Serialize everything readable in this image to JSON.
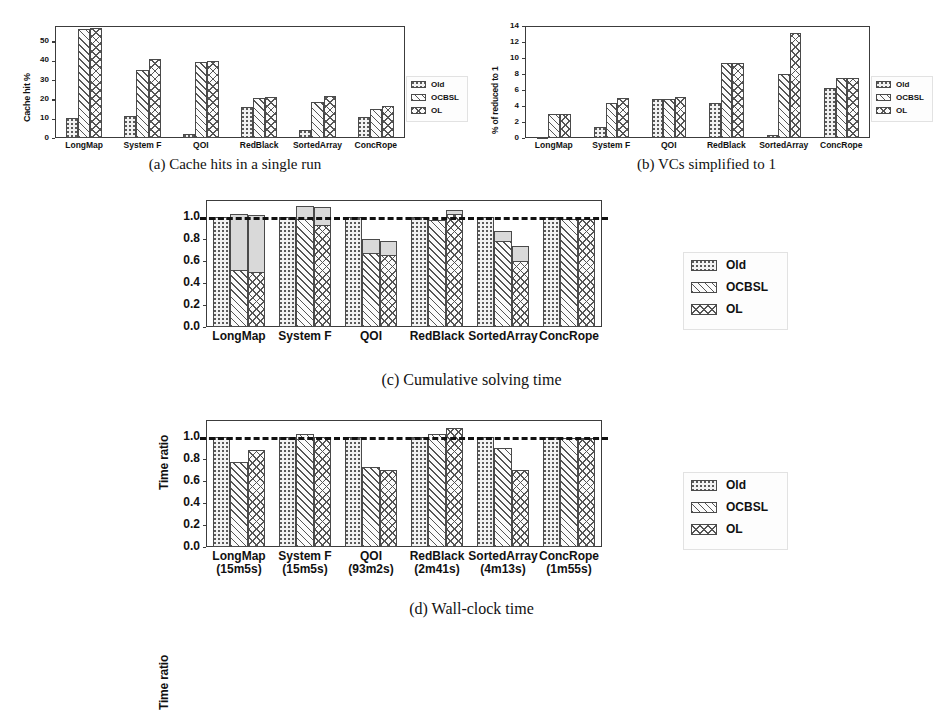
{
  "figure": {
    "panels": [
      {
        "id": "a",
        "caption": "(a) Cache hits in a single run",
        "ylabel": "Cache hit %"
      },
      {
        "id": "b",
        "caption": "(b) VCs simplified to 1",
        "ylabel": "% of reduced to 1"
      },
      {
        "id": "c",
        "caption": "(c) Cumulative solving time",
        "ylabel": "Time ratio"
      },
      {
        "id": "d",
        "caption": "(d) Wall-clock time",
        "ylabel": "Time ratio"
      }
    ],
    "legend": {
      "entries": [
        {
          "label": "Old",
          "fill": "dotted",
          "color": "#f2f2f2"
        },
        {
          "label": "OCBSL",
          "fill": "diagonal-hatch",
          "color": "#fbfbfb"
        },
        {
          "label": "OL",
          "fill": "cross-hatch",
          "color": "#fbfbfb"
        }
      ]
    },
    "reference_line": {
      "value": 1.0,
      "style": "dashed",
      "color": "#111111"
    },
    "stack_cap_color": "#d9d9d9"
  },
  "chart_data": [
    {
      "type": "bar",
      "id": "a",
      "title": "(a) Cache hits in a single run",
      "xlabel": "",
      "ylabel": "Cache hit %",
      "ylim": [
        0,
        58
      ],
      "yticks": [
        0,
        10,
        20,
        30,
        40,
        50
      ],
      "grid": false,
      "legend_position": "right",
      "categories": [
        "LongMap",
        "System F",
        "QOI",
        "RedBlack",
        "SortedArray",
        "ConcRope"
      ],
      "series": [
        {
          "name": "Old",
          "values": [
            10.5,
            11.2,
            2.2,
            16.3,
            4.3,
            11.0
          ]
        },
        {
          "name": "OCBSL",
          "values": [
            56.5,
            35.2,
            39.3,
            20.8,
            18.6,
            15.2
          ]
        },
        {
          "name": "OL",
          "values": [
            56.8,
            40.8,
            40.0,
            21.2,
            22.0,
            16.5
          ]
        }
      ]
    },
    {
      "type": "bar",
      "id": "b",
      "title": "(b) VCs simplified to 1",
      "xlabel": "",
      "ylabel": "% of reduced to 1",
      "ylim": [
        0,
        14
      ],
      "yticks": [
        0,
        2,
        4,
        6,
        8,
        10,
        12,
        14
      ],
      "grid": false,
      "legend_position": "right",
      "categories": [
        "LongMap",
        "System F",
        "QOI",
        "RedBlack",
        "SortedArray",
        "ConcRope"
      ],
      "series": [
        {
          "name": "Old",
          "values": [
            0.15,
            1.4,
            4.85,
            4.4,
            0.35,
            6.3
          ]
        },
        {
          "name": "OCBSL",
          "values": [
            2.95,
            4.4,
            4.9,
            9.35,
            8.0,
            7.5
          ]
        },
        {
          "name": "OL",
          "values": [
            2.95,
            5.05,
            5.15,
            9.35,
            13.1,
            7.5
          ]
        }
      ]
    },
    {
      "type": "bar",
      "id": "c",
      "title": "(c) Cumulative solving time",
      "xlabel": "",
      "ylabel": "Time ratio",
      "ylim": [
        0.0,
        1.15
      ],
      "yticks": [
        0.0,
        0.2,
        0.4,
        0.6,
        0.8,
        1.0
      ],
      "ytick_labels": [
        "0.0",
        "0.2",
        "0.4",
        "0.6",
        "0.8",
        "1.0"
      ],
      "grid": false,
      "legend_position": "right",
      "reference_line": 1.0,
      "stacked_top_segment": "light gray overhead cap",
      "categories": [
        "LongMap",
        "System F",
        "QOI",
        "RedBlack",
        "SortedArray",
        "ConcRope"
      ],
      "series": [
        {
          "name": "Old",
          "values": [
            1.0,
            1.0,
            1.0,
            1.0,
            1.0,
            1.0
          ],
          "totals": [
            1.0,
            1.0,
            1.0,
            1.0,
            1.0,
            1.0
          ]
        },
        {
          "name": "OCBSL",
          "values": [
            0.52,
            0.98,
            0.67,
            0.97,
            0.78,
            0.98
          ],
          "totals": [
            1.02,
            1.1,
            0.8,
            0.97,
            0.87,
            0.98
          ]
        },
        {
          "name": "OL",
          "values": [
            0.5,
            0.92,
            0.65,
            1.02,
            0.6,
            0.98
          ],
          "totals": [
            1.01,
            1.09,
            0.78,
            1.06,
            0.73,
            0.98
          ]
        }
      ]
    },
    {
      "type": "bar",
      "id": "d",
      "title": "(d) Wall-clock time",
      "xlabel": "",
      "ylabel": "Time ratio",
      "ylim": [
        0.0,
        1.15
      ],
      "yticks": [
        0.0,
        0.2,
        0.4,
        0.6,
        0.8,
        1.0
      ],
      "ytick_labels": [
        "0.0",
        "0.2",
        "0.4",
        "0.6",
        "0.8",
        "1.0"
      ],
      "grid": false,
      "legend_position": "right",
      "reference_line": 1.0,
      "categories": [
        "LongMap",
        "System F",
        "QOI",
        "RedBlack",
        "SortedArray",
        "ConcRope"
      ],
      "category_sublabels": [
        "(15m5s)",
        "(15m5s)",
        "(93m2s)",
        "(2m41s)",
        "(4m13s)",
        "(1m55s)"
      ],
      "series": [
        {
          "name": "Old",
          "values": [
            1.0,
            1.0,
            1.0,
            1.0,
            1.0,
            1.0
          ]
        },
        {
          "name": "OCBSL",
          "values": [
            0.77,
            1.02,
            0.72,
            1.02,
            0.9,
            0.99
          ]
        },
        {
          "name": "OL",
          "values": [
            0.88,
            1.0,
            0.7,
            1.08,
            0.7,
            0.99
          ]
        }
      ]
    }
  ]
}
